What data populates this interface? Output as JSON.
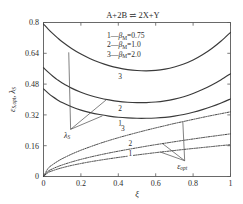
{
  "chart_data": {
    "type": "line",
    "title": "A+2B ⇌ 2X+Y",
    "xlabel": "ξ",
    "ylabel": "εS,opt , λS",
    "ylabel_parts": {
      "eps": "ε",
      "eps_sub": "S,opt",
      "comma": ", ",
      "lam": "λ",
      "lam_sub": "S"
    },
    "xlim": [
      0,
      1
    ],
    "ylim": [
      0,
      0.8
    ],
    "xticks": [
      "0",
      "0.2",
      "0.4",
      "0.6",
      "0.8",
      "1"
    ],
    "xtick_values": [
      0,
      0.2,
      0.4,
      0.6,
      0.8,
      1
    ],
    "yticks": [
      "0",
      "0.16",
      "0.32",
      "0.48",
      "0.64",
      "0.8"
    ],
    "ytick_values": [
      0,
      0.16,
      0.32,
      0.48,
      0.64,
      0.8
    ],
    "grid": false,
    "legend_position": "upper-center",
    "legend": [
      {
        "tag": "1",
        "dash": "—",
        "symbol": "β",
        "subscript": "M",
        "equals": "=",
        "value": "0.75"
      },
      {
        "tag": "2",
        "dash": "—",
        "symbol": "β",
        "subscript": "M",
        "equals": "=",
        "value": "1.0"
      },
      {
        "tag": "3",
        "dash": "—",
        "symbol": "β",
        "subscript": "M",
        "equals": "=",
        "value": "2.0"
      }
    ],
    "x": [
      0,
      0.025,
      0.05,
      0.075,
      0.1,
      0.15,
      0.2,
      0.25,
      0.3,
      0.35,
      0.4,
      0.45,
      0.5,
      0.55,
      0.6,
      0.65,
      0.7,
      0.75,
      0.8,
      0.85,
      0.9,
      0.95,
      1
    ],
    "series": [
      {
        "name": "λS, βM=0.75",
        "tag": "1",
        "style": "solid",
        "group": "lambda",
        "values": [
          0.455,
          0.433,
          0.414,
          0.398,
          0.384,
          0.362,
          0.345,
          0.332,
          0.322,
          0.314,
          0.308,
          0.3045,
          0.3025,
          0.3025,
          0.304,
          0.3075,
          0.3135,
          0.322,
          0.3335,
          0.3475,
          0.3635,
          0.382,
          0.403
        ]
      },
      {
        "name": "λS, βM=1.0",
        "tag": "2",
        "style": "solid",
        "group": "lambda",
        "values": [
          0.565,
          0.542,
          0.521,
          0.502,
          0.486,
          0.459,
          0.438,
          0.421,
          0.408,
          0.398,
          0.39,
          0.3855,
          0.3835,
          0.384,
          0.387,
          0.393,
          0.402,
          0.4145,
          0.431,
          0.4515,
          0.4755,
          0.503,
          0.534
        ]
      },
      {
        "name": "λS, βM=2.0",
        "tag": "3",
        "style": "solid",
        "group": "lambda",
        "values": [
          0.792,
          0.766,
          0.742,
          0.72,
          0.7,
          0.665,
          0.636,
          0.612,
          0.592,
          0.576,
          0.564,
          0.5555,
          0.5505,
          0.549,
          0.551,
          0.5575,
          0.5685,
          0.584,
          0.605,
          0.632,
          0.665,
          0.704,
          0.749
        ]
      },
      {
        "name": "εopt, βM=0.75",
        "tag": "1",
        "style": "dotted",
        "group": "epsilon",
        "values": [
          0,
          0.0205,
          0.0305,
          0.0385,
          0.0455,
          0.0575,
          0.0675,
          0.0765,
          0.0845,
          0.092,
          0.099,
          0.1055,
          0.112,
          0.118,
          0.124,
          0.1295,
          0.135,
          0.1405,
          0.1455,
          0.1505,
          0.1555,
          0.1605,
          0.165
        ]
      },
      {
        "name": "εopt, βM=1.0",
        "tag": "2",
        "style": "dotted",
        "group": "epsilon",
        "values": [
          0,
          0.0275,
          0.0405,
          0.051,
          0.06,
          0.0755,
          0.089,
          0.101,
          0.112,
          0.122,
          0.1315,
          0.1405,
          0.149,
          0.1575,
          0.1655,
          0.173,
          0.1805,
          0.188,
          0.195,
          0.202,
          0.2085,
          0.215,
          0.2215
        ]
      },
      {
        "name": "εopt, βM=2.0",
        "tag": "3",
        "style": "dotted",
        "group": "epsilon",
        "values": [
          0,
          0.0425,
          0.0625,
          0.0785,
          0.0925,
          0.116,
          0.1365,
          0.1545,
          0.1715,
          0.187,
          0.2015,
          0.215,
          0.228,
          0.2405,
          0.2525,
          0.264,
          0.2755,
          0.286,
          0.2965,
          0.307,
          0.317,
          0.3265,
          0.336
        ]
      }
    ],
    "curve_tags": [
      {
        "text": "3",
        "group": "lambda",
        "x": 0.41,
        "y": 0.505
      },
      {
        "text": "2",
        "group": "lambda",
        "x": 0.41,
        "y": 0.342
      },
      {
        "text": "1",
        "group": "lambda",
        "x": 0.41,
        "y": 0.262
      },
      {
        "text": "3",
        "group": "epsilon",
        "x": 0.425,
        "y": 0.238
      },
      {
        "text": "2",
        "group": "epsilon",
        "x": 0.465,
        "y": 0.16
      },
      {
        "text": "1",
        "group": "epsilon",
        "x": 0.465,
        "y": 0.108
      }
    ],
    "annotations": [
      {
        "name": "lambda-s",
        "symbol": "λ",
        "subscript": "S",
        "anchor_x": 0.145,
        "anchor_y": 0.245,
        "targets": [
          {
            "x": 0.135,
            "y": 0.645
          },
          {
            "x": 0.335,
            "y": 0.398
          },
          {
            "x": 0.315,
            "y": 0.315
          }
        ]
      },
      {
        "name": "epsilon-opt",
        "symbol": "ε",
        "subscript": "opt",
        "anchor_x": 0.755,
        "anchor_y": 0.082,
        "targets": [
          {
            "x": 0.745,
            "y": 0.284
          },
          {
            "x": 0.635,
            "y": 0.172
          },
          {
            "x": 0.625,
            "y": 0.127
          }
        ]
      }
    ]
  }
}
